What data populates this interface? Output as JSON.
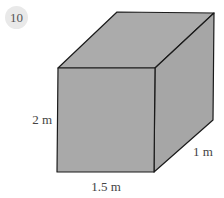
{
  "question": {
    "number": "10"
  },
  "figure": {
    "shape": "cuboid",
    "fill_color": "#a9a9a9",
    "edge_color": "#1a1a1a",
    "labels": {
      "height": "2 m",
      "width": "1.5 m",
      "depth": "1 m"
    }
  }
}
